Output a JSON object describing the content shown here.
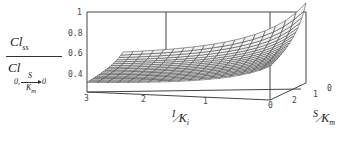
{
  "chart_data": {
    "type": "surface3d",
    "title": "",
    "zlabel": "Cl_ss / Cl_(0, S/K_m -> 0)",
    "zlabel_parts": {
      "numerator": "Cl",
      "numerator_sub": "ss",
      "denominator": "Cl",
      "denominator_sub_left": "0,",
      "denominator_sub_frac_top": "S",
      "denominator_sub_frac_bottom": "K",
      "denominator_sub_frac_bottom_sub": "m",
      "denominator_sub_right": "0"
    },
    "xlabel": "I/K_i",
    "xlabel_parts": {
      "top": "I",
      "bottom": "K",
      "bottom_sub": "i"
    },
    "ylabel": "S/K_m",
    "ylabel_parts": {
      "top": "S",
      "bottom": "K",
      "bottom_sub": "m"
    },
    "z_ticks": [
      "1",
      "0.8",
      "0.6",
      "0.4"
    ],
    "x_ticks": [
      "3",
      "2",
      "1",
      "0"
    ],
    "y_ticks": [
      "2",
      "1",
      "0"
    ],
    "zlim": [
      0.35,
      1.0
    ],
    "xlim": [
      0,
      3
    ],
    "ylim": [
      0,
      3
    ],
    "corner_values": {
      "I0_S0": 1.0,
      "I3_S0": 0.36,
      "I0_S3": 0.42,
      "I3_S3": 0.36
    },
    "grid": "mesh",
    "box": true
  }
}
